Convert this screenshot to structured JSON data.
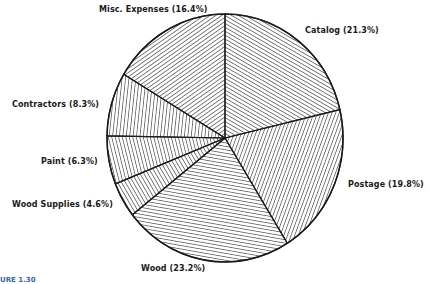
{
  "chart_data": {
    "type": "pie",
    "title": "",
    "start_angle_deg": 0,
    "direction": "clockwise",
    "slices": [
      {
        "label": "Catalog",
        "value": 21.3,
        "display": "Catalog (21.3%)",
        "hatch": "diag-up",
        "hatch_angle": 60
      },
      {
        "label": "Postage",
        "value": 19.8,
        "display": "Postage (19.8%)",
        "hatch": "diag-shallow-down",
        "hatch_angle": -20
      },
      {
        "label": "Wood",
        "value": 23.2,
        "display": "Wood (23.2%)",
        "hatch": "near-vertical",
        "hatch_angle": 80
      },
      {
        "label": "Wood Supplies",
        "value": 4.6,
        "display": "Wood Supplies (4.6%)",
        "hatch": "diag-30",
        "hatch_angle": 30
      },
      {
        "label": "Paint",
        "value": 6.3,
        "display": "Paint (6.3%)",
        "hatch": "shallow-up",
        "hatch_angle": 14
      },
      {
        "label": "Contractors",
        "value": 8.3,
        "display": "Contractors (8.3%)",
        "hatch": "near-horizontal",
        "hatch_angle": -6
      },
      {
        "label": "Misc. Expenses",
        "value": 16.4,
        "display": "Misc. Expenses (16.4%)",
        "hatch": "diag-down",
        "hatch_angle": -55
      }
    ],
    "categories": [
      "Catalog",
      "Postage",
      "Wood",
      "Wood Supplies",
      "Paint",
      "Contractors",
      "Misc. Expenses"
    ],
    "values": [
      21.3,
      19.8,
      23.2,
      4.6,
      6.3,
      8.3,
      16.4
    ],
    "legend": "none (labels placed around slices)",
    "fill_style": "black line hatching on white"
  },
  "labels": {
    "catalog": "Catalog (21.3%)",
    "postage": "Postage (19.8%)",
    "wood": "Wood (23.2%)",
    "wood_supplies": "Wood Supplies (4.6%)",
    "paint": "Paint (6.3%)",
    "contractors": "Contractors (8.3%)",
    "misc": "Misc. Expenses (16.4%)"
  },
  "caption": "URE 1.30",
  "colors": {
    "ink": "#1a1a1a",
    "background": "#ffffff",
    "caption": "#3a63b8"
  }
}
